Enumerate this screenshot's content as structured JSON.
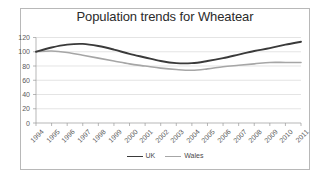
{
  "chart_data": {
    "type": "line",
    "title": "Population trends for Wheatear",
    "xlabel": "",
    "ylabel": "",
    "ylim": [
      0,
      120
    ],
    "ytick_step": 20,
    "yticks": [
      "0",
      "20",
      "40",
      "60",
      "80",
      "100",
      "120"
    ],
    "grid": true,
    "legend_position": "bottom",
    "categories": [
      "1994",
      "1995",
      "1996",
      "1997",
      "1998",
      "1999",
      "2000",
      "2001",
      "2002",
      "2003",
      "2004",
      "2005",
      "2006",
      "2007",
      "2008",
      "2009",
      "2010",
      "2011"
    ],
    "series": [
      {
        "name": "UK",
        "color": "#3a3a3a",
        "width": 1.9,
        "values": [
          100,
          106,
          110,
          111,
          108,
          103,
          97,
          92,
          87,
          84,
          84,
          87,
          91,
          96,
          101,
          105,
          110,
          114
        ]
      },
      {
        "name": "Wales",
        "color": "#a6a6a6",
        "width": 1.6,
        "values": [
          100,
          101,
          99,
          95,
          91,
          87,
          83,
          80,
          77,
          75,
          74,
          76,
          79,
          81,
          83,
          85,
          85,
          85
        ]
      }
    ]
  },
  "frame": {
    "border_color": "#b8b8b8",
    "background": "#ffffff",
    "gridline_color": "#d9d9d9",
    "axis_color": "#9a9a9a",
    "tick_text_color": "#5a5a5a",
    "title_color": "#2b2b2b"
  }
}
